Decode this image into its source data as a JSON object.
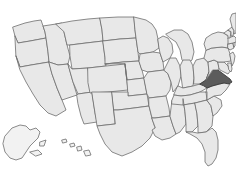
{
  "map": {
    "title": "United States map",
    "type": "choropleth-single-highlight",
    "background_color": "#ffffff",
    "state_fill_color": "#e8e8e8",
    "state_border_color": "#6d6d6d",
    "highlight_fill_color": "#5c5c5c",
    "highlight_border_color": "#3a3a3a",
    "outlying_fill_color": "#f2f2f2",
    "highlighted_states": [
      "Virginia"
    ],
    "projection_note": "Alaska and Hawaii shown as insets at lower left",
    "legend": null,
    "labels": [],
    "states": [
      {
        "id": "WA",
        "name": "Washington",
        "highlighted": false
      },
      {
        "id": "OR",
        "name": "Oregon",
        "highlighted": false
      },
      {
        "id": "CA",
        "name": "California",
        "highlighted": false
      },
      {
        "id": "ID",
        "name": "Idaho",
        "highlighted": false
      },
      {
        "id": "NV",
        "name": "Nevada",
        "highlighted": false
      },
      {
        "id": "MT",
        "name": "Montana",
        "highlighted": false
      },
      {
        "id": "WY",
        "name": "Wyoming",
        "highlighted": false
      },
      {
        "id": "UT",
        "name": "Utah",
        "highlighted": false
      },
      {
        "id": "AZ",
        "name": "Arizona",
        "highlighted": false
      },
      {
        "id": "CO",
        "name": "Colorado",
        "highlighted": false
      },
      {
        "id": "NM",
        "name": "New Mexico",
        "highlighted": false
      },
      {
        "id": "ND",
        "name": "North Dakota",
        "highlighted": false
      },
      {
        "id": "SD",
        "name": "South Dakota",
        "highlighted": false
      },
      {
        "id": "NE",
        "name": "Nebraska",
        "highlighted": false
      },
      {
        "id": "KS",
        "name": "Kansas",
        "highlighted": false
      },
      {
        "id": "OK",
        "name": "Oklahoma",
        "highlighted": false
      },
      {
        "id": "TX",
        "name": "Texas",
        "highlighted": false
      },
      {
        "id": "MN",
        "name": "Minnesota",
        "highlighted": false
      },
      {
        "id": "IA",
        "name": "Iowa",
        "highlighted": false
      },
      {
        "id": "MO",
        "name": "Missouri",
        "highlighted": false
      },
      {
        "id": "AR",
        "name": "Arkansas",
        "highlighted": false
      },
      {
        "id": "LA",
        "name": "Louisiana",
        "highlighted": false
      },
      {
        "id": "WI",
        "name": "Wisconsin",
        "highlighted": false
      },
      {
        "id": "IL",
        "name": "Illinois",
        "highlighted": false
      },
      {
        "id": "MS",
        "name": "Mississippi",
        "highlighted": false
      },
      {
        "id": "MI",
        "name": "Michigan",
        "highlighted": false
      },
      {
        "id": "IN",
        "name": "Indiana",
        "highlighted": false
      },
      {
        "id": "OH",
        "name": "Ohio",
        "highlighted": false
      },
      {
        "id": "KY",
        "name": "Kentucky",
        "highlighted": false
      },
      {
        "id": "TN",
        "name": "Tennessee",
        "highlighted": false
      },
      {
        "id": "AL",
        "name": "Alabama",
        "highlighted": false
      },
      {
        "id": "GA",
        "name": "Georgia",
        "highlighted": false
      },
      {
        "id": "FL",
        "name": "Florida",
        "highlighted": false
      },
      {
        "id": "SC",
        "name": "South Carolina",
        "highlighted": false
      },
      {
        "id": "NC",
        "name": "North Carolina",
        "highlighted": false
      },
      {
        "id": "VA",
        "name": "Virginia",
        "highlighted": true
      },
      {
        "id": "WV",
        "name": "West Virginia",
        "highlighted": false
      },
      {
        "id": "MD",
        "name": "Maryland",
        "highlighted": false
      },
      {
        "id": "DE",
        "name": "Delaware",
        "highlighted": false
      },
      {
        "id": "PA",
        "name": "Pennsylvania",
        "highlighted": false
      },
      {
        "id": "NJ",
        "name": "New Jersey",
        "highlighted": false
      },
      {
        "id": "NY",
        "name": "New York",
        "highlighted": false
      },
      {
        "id": "CT",
        "name": "Connecticut",
        "highlighted": false
      },
      {
        "id": "RI",
        "name": "Rhode Island",
        "highlighted": false
      },
      {
        "id": "MA",
        "name": "Massachusetts",
        "highlighted": false
      },
      {
        "id": "VT",
        "name": "Vermont",
        "highlighted": false
      },
      {
        "id": "NH",
        "name": "New Hampshire",
        "highlighted": false
      },
      {
        "id": "ME",
        "name": "Maine",
        "highlighted": false
      },
      {
        "id": "AK",
        "name": "Alaska",
        "highlighted": false
      },
      {
        "id": "HI",
        "name": "Hawaii",
        "highlighted": false
      }
    ]
  }
}
